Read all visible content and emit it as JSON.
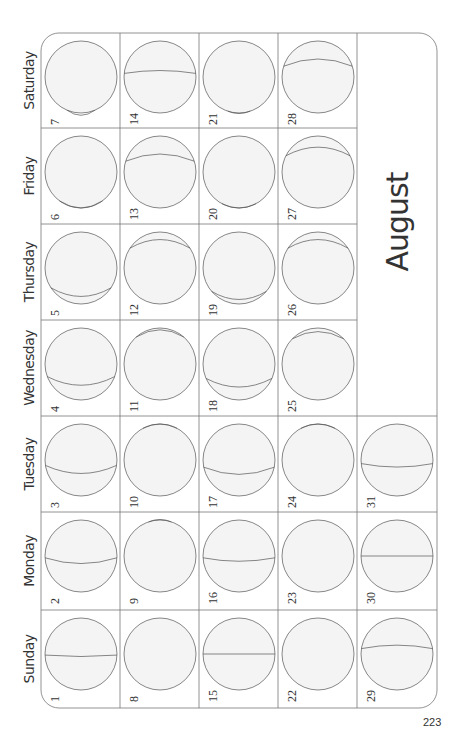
{
  "calendar": {
    "month": "August",
    "page_number": "223",
    "days": [
      "Saturday",
      "Friday",
      "Thursday",
      "Wednesday",
      "Tuesday",
      "Monday",
      "Sunday"
    ],
    "colors": {
      "line": "#555555",
      "grid": "#777777",
      "moon_fill": "#f4f4f4",
      "moon_shade": "#e8e8e8"
    },
    "weeks": [
      [
        {
          "day": "7",
          "t": 0.92,
          "b": 0.18
        },
        {
          "day": "6",
          "t": 0.8,
          "b": 0.25
        },
        {
          "day": "5",
          "t": 0.55,
          "b": 0.3
        },
        {
          "day": "4",
          "t": 0.35,
          "b": 0.3
        },
        {
          "day": "3",
          "t": 0.15,
          "b": 0.28
        },
        {
          "day": "2",
          "t": 0.05,
          "b": 0.2
        },
        {
          "day": "1",
          "t": 0.03,
          "b": 0.05
        }
      ],
      [
        {
          "day": "14",
          "t": -0.1,
          "b": -0.1
        },
        {
          "day": "13",
          "t": -0.3,
          "b": -0.25
        },
        {
          "day": "12",
          "t": -0.55,
          "b": -0.3
        },
        {
          "day": "11",
          "t": -0.75,
          "b": -0.25
        },
        {
          "day": "10",
          "t": -0.88,
          "b": -0.15
        },
        {
          "day": "9",
          "t": -0.95,
          "b": -0.08
        },
        {
          "day": "8",
          "t": -1.0,
          "b": 0.0,
          "full": true
        }
      ],
      [
        {
          "day": "21",
          "t": 0.95,
          "b": 0.08
        },
        {
          "day": "20",
          "t": 0.88,
          "b": 0.15
        },
        {
          "day": "19",
          "t": 0.65,
          "b": 0.28
        },
        {
          "day": "18",
          "t": 0.4,
          "b": 0.3
        },
        {
          "day": "17",
          "t": 0.2,
          "b": 0.25
        },
        {
          "day": "16",
          "t": 0.05,
          "b": 0.12
        },
        {
          "day": "15",
          "t": 0.0,
          "b": 0.0
        }
      ],
      [
        {
          "day": "28",
          "t": -0.3,
          "b": -0.25
        },
        {
          "day": "27",
          "t": -0.45,
          "b": -0.3
        },
        {
          "day": "26",
          "t": -0.55,
          "b": -0.3
        },
        {
          "day": "25",
          "t": -0.7,
          "b": -0.25
        },
        {
          "day": "24",
          "t": -0.88,
          "b": -0.15
        },
        {
          "day": "23",
          "t": -1.0,
          "b": 0.0,
          "full": true
        },
        {
          "day": "22",
          "t": -1.0,
          "b": 0.0,
          "full": true
        }
      ],
      [
        null,
        null,
        null,
        null,
        {
          "day": "31",
          "t": 0.1,
          "b": 0.12
        },
        {
          "day": "30",
          "t": 0.0,
          "b": 0.0
        },
        {
          "day": "29",
          "t": -0.15,
          "b": -0.12
        }
      ]
    ]
  }
}
